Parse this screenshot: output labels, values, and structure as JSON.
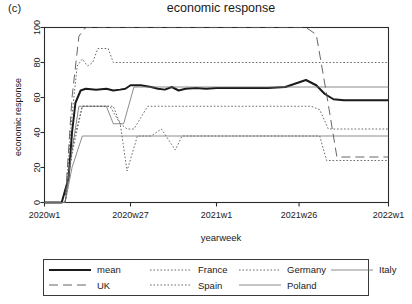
{
  "figure": {
    "panel_tag": "(c)",
    "title": "economic response",
    "xlabel": "yearweek",
    "ylabel": "economic response"
  },
  "axes": {
    "yticks": [
      "0",
      "20",
      "40",
      "60",
      "80",
      "100"
    ],
    "xticks": [
      "2020w1",
      "2020w27",
      "2021w1",
      "2021w26",
      "2022w1"
    ]
  },
  "legend": {
    "entries": [
      {
        "label": "mean",
        "style": "thick-solid"
      },
      {
        "label": "France",
        "style": "fine-dotted"
      },
      {
        "label": "Germany",
        "style": "fine-dotted"
      },
      {
        "label": "Italy",
        "style": "thin-solid"
      },
      {
        "label": "UK",
        "style": "long-dashed"
      },
      {
        "label": "Spain",
        "style": "fine-dotted"
      },
      {
        "label": "Poland",
        "style": "thin-solid"
      }
    ]
  },
  "chart_data": {
    "type": "line",
    "title": "economic response",
    "xlabel": "yearweek",
    "ylabel": "economic response",
    "xlim": [
      2020.0,
      2022.0
    ],
    "ylim": [
      0,
      100
    ],
    "grid": false,
    "legend_position": "below-plot",
    "xtick_values": [
      2020.0,
      2020.5,
      2021.0,
      2021.48,
      2022.0
    ],
    "xtick_labels": [
      "2020w1",
      "2020w27",
      "2021w1",
      "2021w26",
      "2022w1"
    ],
    "ytick_values": [
      0,
      20,
      40,
      60,
      80,
      100
    ],
    "series": [
      {
        "name": "mean",
        "style": "thick-solid",
        "x": [
          2020.0,
          2020.1,
          2020.14,
          2020.16,
          2020.18,
          2020.21,
          2020.24,
          2020.3,
          2020.36,
          2020.4,
          2020.44,
          2020.47,
          2020.5,
          2020.56,
          2020.62,
          2020.66,
          2020.7,
          2020.74,
          2020.78,
          2020.82,
          2020.88,
          2020.94,
          2021.0,
          2021.1,
          2021.2,
          2021.3,
          2021.4,
          2021.46,
          2021.52,
          2021.58,
          2021.63,
          2021.68,
          2021.74,
          2021.8,
          2022.0
        ],
        "y": [
          0,
          0,
          14,
          40,
          57,
          64,
          65,
          64.5,
          65,
          64,
          64.5,
          65,
          67,
          67,
          66,
          65,
          64.5,
          66,
          64,
          65,
          65.5,
          65,
          65.5,
          65.5,
          65.5,
          65.5,
          66,
          68,
          70,
          67,
          62,
          59,
          58.5,
          58.5,
          58.5
        ]
      },
      {
        "name": "France",
        "style": "fine-dotted",
        "x": [
          2020.0,
          2020.12,
          2020.16,
          2020.19,
          2020.22,
          2020.25,
          2020.28,
          2020.31,
          2020.34,
          2020.37,
          2020.4,
          2020.44,
          2020.47,
          2020.52,
          2021.0,
          2021.45,
          2021.62,
          2021.66,
          2021.72,
          2022.0
        ],
        "y": [
          0,
          0,
          50,
          78,
          82,
          78,
          80,
          88,
          88,
          88,
          80,
          80,
          80,
          80,
          80,
          80,
          80,
          80,
          80,
          80
        ]
      },
      {
        "name": "Germany",
        "style": "fine-dotted",
        "x": [
          2020.0,
          2020.12,
          2020.17,
          2020.22,
          2020.28,
          2020.4,
          2020.44,
          2020.48,
          2020.52,
          2020.6,
          2021.0,
          2021.35,
          2021.45,
          2021.55,
          2021.6,
          2021.65,
          2021.7,
          2022.0
        ],
        "y": [
          0,
          0,
          36,
          55,
          55,
          55,
          45,
          42,
          42,
          55,
          55,
          55,
          55,
          55,
          53,
          42,
          42,
          42
        ]
      },
      {
        "name": "Italy",
        "style": "thin-solid",
        "x": [
          2020.0,
          2020.12,
          2020.16,
          2020.2,
          2020.26,
          2020.36,
          2020.4,
          2020.46,
          2020.52,
          2021.0,
          2021.4,
          2021.5,
          2021.56,
          2021.6,
          2022.0
        ],
        "y": [
          0,
          0,
          30,
          55,
          55,
          55,
          45,
          45,
          66,
          66,
          66,
          66,
          66,
          66,
          66
        ]
      },
      {
        "name": "UK",
        "style": "long-dashed",
        "x": [
          2020.0,
          2020.12,
          2020.16,
          2020.2,
          2020.24,
          2020.32,
          2020.42,
          2020.5,
          2021.0,
          2021.4,
          2021.52,
          2021.58,
          2021.64,
          2021.7,
          2022.0
        ],
        "y": [
          0,
          0,
          60,
          95,
          100,
          100,
          100,
          100,
          100,
          100,
          100,
          96,
          62,
          26,
          26
        ]
      },
      {
        "name": "Spain",
        "style": "fine-dotted",
        "x": [
          2020.0,
          2020.12,
          2020.16,
          2020.22,
          2020.3,
          2020.38,
          2020.44,
          2020.48,
          2020.54,
          2020.62,
          2020.68,
          2020.72,
          2020.76,
          2020.8,
          2020.86,
          2021.0,
          2021.4,
          2021.55,
          2021.6,
          2021.64,
          2021.7,
          2022.0
        ],
        "y": [
          0,
          0,
          28,
          55,
          55,
          55,
          45,
          18,
          38,
          38,
          42,
          36,
          30,
          38,
          38,
          38,
          38,
          38,
          38,
          24,
          24,
          24
        ]
      },
      {
        "name": "Poland",
        "style": "thin-solid",
        "x": [
          2020.0,
          2020.12,
          2020.16,
          2020.22,
          2020.3,
          2020.4,
          2020.48,
          2021.0,
          2021.5,
          2022.0
        ],
        "y": [
          0,
          0,
          20,
          38,
          38,
          38,
          38,
          38,
          38,
          38
        ]
      }
    ]
  }
}
